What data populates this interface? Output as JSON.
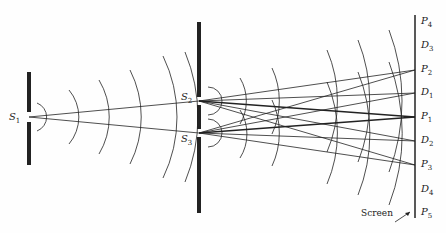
{
  "figure": {
    "type": "double-slit interference diagram",
    "sources": [
      {
        "id": "S1",
        "label": "S",
        "sub": "1",
        "x": 29,
        "y": 117
      },
      {
        "id": "S2",
        "label": "S",
        "sub": "2",
        "x": 199,
        "y": 101
      },
      {
        "id": "S3",
        "label": "S",
        "sub": "3",
        "x": 199,
        "y": 133
      }
    ],
    "screen": {
      "label": "Screen",
      "x": 415,
      "points": [
        {
          "label": "P",
          "sub": "4",
          "y": 22
        },
        {
          "label": "D",
          "sub": "3",
          "y": 46
        },
        {
          "label": "P",
          "sub": "2",
          "y": 70
        },
        {
          "label": "D",
          "sub": "1",
          "y": 93
        },
        {
          "label": "P",
          "sub": "1",
          "y": 117
        },
        {
          "label": "D",
          "sub": "2",
          "y": 141
        },
        {
          "label": "P",
          "sub": "3",
          "y": 165
        },
        {
          "label": "D",
          "sub": "4",
          "y": 190
        },
        {
          "label": "P",
          "sub": "5",
          "y": 213
        }
      ]
    },
    "colors": {
      "ink": "#222222",
      "background": "#fefefe"
    }
  }
}
